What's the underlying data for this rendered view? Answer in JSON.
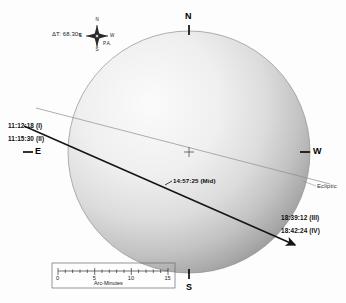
{
  "diagram": {
    "type": "solar-eclipse-local-circumstances",
    "delta_t": "ΔT: 68.30s",
    "ecliptic_label": "Ecliptic",
    "mid_eclipse": "14:57:25 (Mid)",
    "cardinal": {
      "north": "N",
      "south": "S",
      "east": "E",
      "west": "W"
    },
    "compass_rose": {
      "north": "N",
      "south": "S",
      "east": "E",
      "west": "W",
      "position_angle": "P.A."
    },
    "contacts": [
      {
        "time": "11:12:18 (I)"
      },
      {
        "time": "11:15:30 (II)"
      },
      {
        "time": "18:39:12 (III)"
      },
      {
        "time": "18:42:24 (IV)"
      }
    ],
    "scale": {
      "caption": "Arc-Minutes",
      "ticks": [
        "0",
        "5",
        "10",
        "15"
      ],
      "min": 0,
      "max": 15
    },
    "colors": {
      "disk_light": "#f2f2f2",
      "disk_dark": "#9a9a9a",
      "path_line": "#141414",
      "ecliptic_line": "#8d8d8d",
      "text": "#111111"
    }
  }
}
